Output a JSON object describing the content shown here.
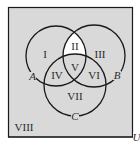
{
  "diagram": {
    "type": "venn-3-set",
    "universe_label": "U",
    "sets": [
      {
        "name": "A",
        "cx": 56,
        "cy": 56,
        "r": 30
      },
      {
        "name": "B",
        "cx": 94,
        "cy": 56,
        "r": 31
      },
      {
        "name": "C",
        "cx": 75,
        "cy": 85,
        "r": 31
      }
    ],
    "regions": [
      {
        "label": "I",
        "x": 45,
        "y": 58
      },
      {
        "label": "II",
        "x": 75,
        "y": 50
      },
      {
        "label": "III",
        "x": 100,
        "y": 58
      },
      {
        "label": "IV",
        "x": 57,
        "y": 79
      },
      {
        "label": "V",
        "x": 75,
        "y": 71
      },
      {
        "label": "VI",
        "x": 94,
        "y": 79
      },
      {
        "label": "VII",
        "x": 75,
        "y": 100
      },
      {
        "label": "VIII",
        "x": 24,
        "y": 131
      }
    ],
    "highlighted_region": "II",
    "colors": {
      "shaded_fill": "#d9d9d9",
      "highlight_fill": "#ffffff",
      "stroke": "#1a1a1a",
      "background": "#ffffff"
    }
  }
}
